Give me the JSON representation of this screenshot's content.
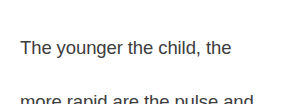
{
  "card": {
    "background_color": "#ffffff",
    "text_color": "#3d3d3d",
    "body_text": "The younger the child, the more rapid are the pulse and respiratory rates.",
    "lines": [
      "The younger the child, the",
      "more rapid are the pulse and",
      "respiratory rates."
    ]
  }
}
